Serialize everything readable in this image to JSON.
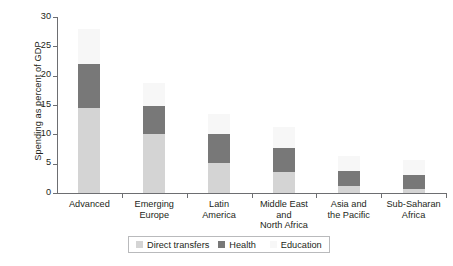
{
  "chart_data": {
    "type": "bar",
    "subtype": "stacked",
    "title": "",
    "xlabel": "",
    "ylabel": "Spending as percent of GDP",
    "ylim": [
      0,
      30
    ],
    "yticks": [
      0,
      5,
      10,
      15,
      20,
      25,
      30
    ],
    "ytick_labels": [
      "0",
      "5",
      "10",
      "15",
      "20",
      "25",
      "30"
    ],
    "grid": false,
    "legend_position": "bottom-center",
    "categories": [
      "Advanced",
      "Emerging Europe",
      "Latin America",
      "Middle East and North Africa",
      "Asia and the Pacific",
      "Sub-Saharan Africa"
    ],
    "category_lines": [
      [
        "Advanced"
      ],
      [
        "Emerging",
        "Europe"
      ],
      [
        "Latin",
        "America"
      ],
      [
        "Middle East and",
        "North Africa"
      ],
      [
        "Asia and",
        "the Pacific"
      ],
      [
        "Sub-Saharan",
        "Africa"
      ]
    ],
    "series": [
      {
        "name": "Direct transfers",
        "color": "#d4d4d4",
        "values": [
          14.5,
          10.1,
          5.1,
          3.6,
          1.2,
          0.7
        ]
      },
      {
        "name": "Health",
        "color": "#787878",
        "values": [
          7.5,
          4.7,
          4.9,
          4.1,
          2.6,
          2.4
        ]
      },
      {
        "name": "Education",
        "color": "#f7f7f7",
        "values": [
          6.0,
          4.0,
          3.5,
          3.5,
          2.5,
          2.5
        ]
      }
    ],
    "totals": [
      28.0,
      18.8,
      13.5,
      11.2,
      6.3,
      5.6
    ]
  },
  "legend": {
    "items": [
      {
        "label": "Direct transfers",
        "color": "#d4d4d4"
      },
      {
        "label": "Health",
        "color": "#787878"
      },
      {
        "label": "Education",
        "color": "#f7f7f7"
      }
    ]
  },
  "axis": {
    "y_title": "Spending as percent of GDP"
  }
}
